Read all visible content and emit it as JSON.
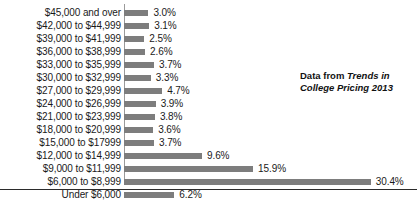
{
  "chart_data": {
    "type": "bar",
    "orientation": "horizontal",
    "title": "",
    "subtitle": "",
    "xlabel": "",
    "ylabel": "",
    "grid": false,
    "legend": null,
    "xlim": [
      0,
      30.4
    ],
    "value_suffix": "%",
    "categories": [
      "$45,000 and over",
      "$42,000 to $44,999",
      "$39,000 to $41,999",
      "$36,000 to $38,999",
      "$33,000 to $35,999",
      "$30,000 to $32,999",
      "$27,000 to $29,999",
      "$24,000 to $26,999",
      "$21,000 to $23,999",
      "$18,000 to $20,999",
      "$15,000 to $17999",
      "$12,000 to $14,999",
      "$9,000 to $11,999",
      "$6,000 to $8,999",
      "Under $6,000"
    ],
    "values": [
      3.0,
      3.1,
      2.5,
      2.6,
      3.7,
      3.3,
      4.7,
      3.9,
      3.8,
      3.6,
      3.7,
      9.6,
      15.9,
      30.4,
      6.2
    ],
    "value_labels": [
      "3.0%",
      "3.1%",
      "2.5%",
      "2.6%",
      "3.7%",
      "3.3%",
      "4.7%",
      "3.9%",
      "3.8%",
      "3.6%",
      "3.7%",
      "9.6%",
      "15.9%",
      "30.4%",
      "6.2%"
    ],
    "bar_color": "#7d7d7d",
    "annotations": [
      {
        "prefix": "Data from ",
        "emphasis": "Trends in College Pricing 2013"
      }
    ]
  }
}
